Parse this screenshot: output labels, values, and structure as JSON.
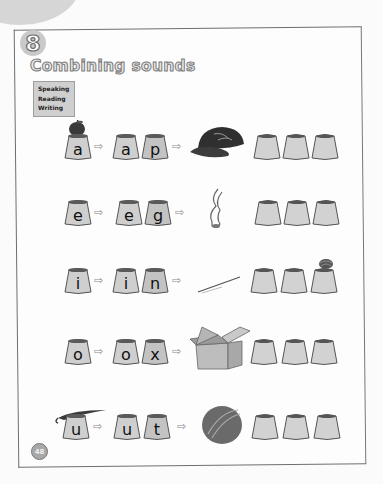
{
  "unit": {
    "number": "8"
  },
  "title": "Combining sounds",
  "skills": [
    "Speaking",
    "Reading",
    "Writing"
  ],
  "rows": [
    {
      "vowel": "a",
      "pair": [
        "a",
        "p"
      ],
      "picture": "cap-icon",
      "cue": "apple-icon",
      "blank_cups": 3
    },
    {
      "vowel": "e",
      "pair": [
        "e",
        "g"
      ],
      "picture": "leg-icon",
      "cue": "",
      "blank_cups": 3
    },
    {
      "vowel": "i",
      "pair": [
        "i",
        "n"
      ],
      "picture": "pin-icon",
      "cue": "",
      "blank_cups": 3,
      "blank_cue": "nest-icon"
    },
    {
      "vowel": "o",
      "pair": [
        "o",
        "x"
      ],
      "picture": "box-icon",
      "cue": "",
      "blank_cups": 3
    },
    {
      "vowel": "u",
      "pair": [
        "u",
        "t"
      ],
      "picture": "nut-icon",
      "cue": "umbrella-icon",
      "blank_cups": 3
    }
  ],
  "arrow_glyph": "⇨",
  "page_number": "48"
}
